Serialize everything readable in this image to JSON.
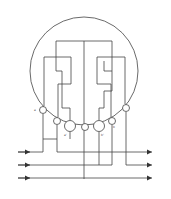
{
  "diagram": {
    "type": "meter-wiring-diagram",
    "terminal_labels": {
      "t1": "a",
      "t3": "a'",
      "t5": "b'",
      "t6": "b"
    },
    "colors": {
      "line": "#444444",
      "background": "#ffffff"
    }
  }
}
